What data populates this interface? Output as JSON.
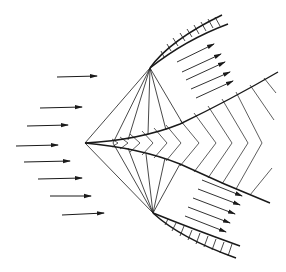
{
  "diagram": {
    "title": "",
    "colors": {
      "line": "#1a1a1a",
      "background": "#ffffff"
    },
    "apex": [
      85,
      143
    ],
    "upper_corner": [
      150,
      68
    ],
    "lower_corner": [
      153,
      213
    ],
    "inflow_arrows": [
      {
        "x1": 57,
        "y1": 77,
        "x2": 97,
        "y2": 76
      },
      {
        "x1": 40,
        "y1": 108,
        "x2": 82,
        "y2": 107
      },
      {
        "x1": 27,
        "y1": 126,
        "x2": 68,
        "y2": 125
      },
      {
        "x1": 16,
        "y1": 146,
        "x2": 58,
        "y2": 145
      },
      {
        "x1": 24,
        "y1": 162,
        "x2": 70,
        "y2": 161
      },
      {
        "x1": 38,
        "y1": 179,
        "x2": 82,
        "y2": 178
      },
      {
        "x1": 50,
        "y1": 196,
        "x2": 91,
        "y2": 196
      },
      {
        "x1": 62,
        "y1": 215,
        "x2": 104,
        "y2": 213
      }
    ],
    "upper_outflow_arrows": [
      {
        "x1": 177,
        "y1": 62,
        "x2": 214,
        "y2": 44
      },
      {
        "x1": 182,
        "y1": 72,
        "x2": 221,
        "y2": 54
      },
      {
        "x1": 186,
        "y1": 80,
        "x2": 225,
        "y2": 62
      },
      {
        "x1": 191,
        "y1": 89,
        "x2": 230,
        "y2": 72
      },
      {
        "x1": 196,
        "y1": 98,
        "x2": 233,
        "y2": 81
      }
    ],
    "lower_outflow_arrows": [
      {
        "x1": 202,
        "y1": 180,
        "x2": 242,
        "y2": 196
      },
      {
        "x1": 198,
        "y1": 189,
        "x2": 240,
        "y2": 205
      },
      {
        "x1": 193,
        "y1": 198,
        "x2": 235,
        "y2": 214
      },
      {
        "x1": 188,
        "y1": 207,
        "x2": 230,
        "y2": 223
      },
      {
        "x1": 185,
        "y1": 216,
        "x2": 226,
        "y2": 232
      }
    ]
  }
}
